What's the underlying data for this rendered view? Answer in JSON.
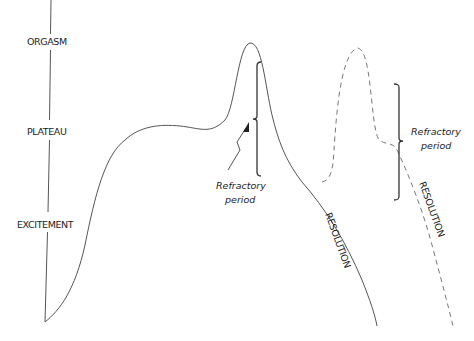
{
  "diagram": {
    "axis_labels": {
      "orgasm": "ORGASM",
      "plateau": "PLATEAU",
      "excitement": "EXCITEMENT"
    },
    "refractory_label_1": {
      "line1": "Refractory",
      "line2": "period"
    },
    "refractory_label_2": {
      "line1": "Refractory",
      "line2": "period"
    },
    "resolution_label_1": "RESOLUTION",
    "resolution_label_2": "RESOLUTION",
    "colors": {
      "line": "#555555",
      "text": "#222222",
      "background": "#ffffff"
    }
  }
}
